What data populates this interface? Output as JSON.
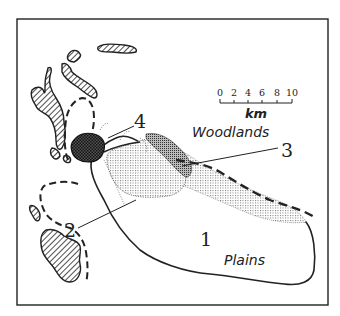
{
  "map": {
    "labels": {
      "zone_1": "1",
      "zone_2": "2",
      "zone_3": "3",
      "zone_4": "4",
      "woodlands": "Woodlands",
      "plains": "Plains"
    },
    "scale_bar": {
      "ticks": [
        "0",
        "2",
        "4",
        "6",
        "8",
        "10"
      ],
      "unit": "km"
    },
    "colors": {
      "ink": "#222222",
      "background": "#ffffff"
    }
  }
}
